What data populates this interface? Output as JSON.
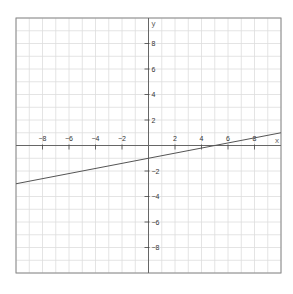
{
  "chart_data": {
    "type": "line",
    "title": "",
    "xlabel": "x",
    "ylabel": "y",
    "xlim": [
      -10,
      10
    ],
    "ylim": [
      -10,
      10
    ],
    "grid": true,
    "grid_step": 1,
    "xticks": [
      -8,
      -6,
      -4,
      -2,
      2,
      4,
      6,
      8
    ],
    "yticks": [
      8,
      6,
      4,
      2,
      -2,
      -4,
      -6,
      -8
    ],
    "series": [
      {
        "name": "y = x/5 - 1",
        "slope": 0.2,
        "intercept": -1,
        "x": [
          -10,
          10
        ],
        "y": [
          -3,
          1
        ],
        "color": "#555555"
      }
    ]
  },
  "colors": {
    "grid": "#dddddd",
    "axis": "#666666",
    "border": "#888888",
    "line": "#555555"
  }
}
